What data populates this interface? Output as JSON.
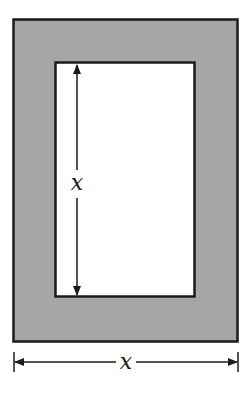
{
  "diagram": {
    "type": "frame-dimension-figure",
    "outer_rect": {
      "x": 13,
      "y": 19,
      "width": 225,
      "height": 323,
      "fill": "#a6a6a6",
      "stroke": "#1a1a1a"
    },
    "inner_rect": {
      "x": 55,
      "y": 62,
      "width": 140,
      "height": 235,
      "fill": "#ffffff",
      "stroke": "#1a1a1a"
    },
    "vertical_dimension": {
      "label": "x",
      "x": 77,
      "y1": 64,
      "y2": 295,
      "label_y": 190
    },
    "horizontal_dimension": {
      "label": "x",
      "y": 362,
      "x1": 14,
      "x2": 238,
      "label_x": 126
    },
    "colors": {
      "frame": "#a6a6a6",
      "line": "#1a1a1a",
      "background": "#ffffff"
    }
  }
}
